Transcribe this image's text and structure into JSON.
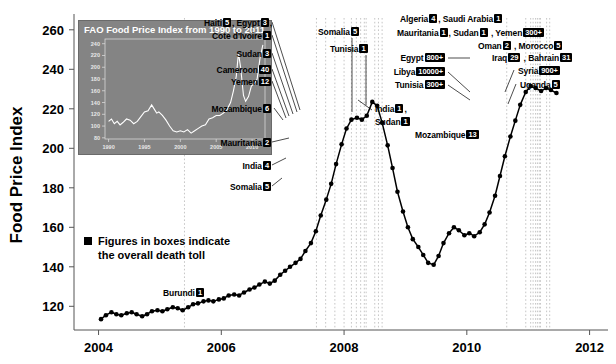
{
  "chart_data": {
    "type": "line",
    "title": "",
    "xlabel": "",
    "ylabel": "Food Price Index",
    "xlim": [
      2003.6,
      2012.3
    ],
    "ylim": [
      108,
      268
    ],
    "xticks": [
      "2004",
      "2006",
      "2008",
      "2010",
      "2012"
    ],
    "yticks": [
      "120",
      "140",
      "160",
      "180",
      "200",
      "220",
      "240",
      "260"
    ],
    "grid": false,
    "legend_note": "Figures in boxes indicate the overall death toll",
    "series": [
      {
        "name": "FAO Food Price Index",
        "x": [
          2004.04,
          2004.12,
          2004.21,
          2004.29,
          2004.37,
          2004.46,
          2004.54,
          2004.62,
          2004.71,
          2004.79,
          2004.87,
          2004.96,
          2005.04,
          2005.12,
          2005.21,
          2005.29,
          2005.37,
          2005.46,
          2005.54,
          2005.62,
          2005.71,
          2005.79,
          2005.87,
          2005.96,
          2006.04,
          2006.12,
          2006.21,
          2006.29,
          2006.37,
          2006.46,
          2006.54,
          2006.62,
          2006.71,
          2006.79,
          2006.87,
          2006.96,
          2007.04,
          2007.12,
          2007.21,
          2007.29,
          2007.37,
          2007.46,
          2007.54,
          2007.62,
          2007.71,
          2007.79,
          2007.87,
          2007.96,
          2008.04,
          2008.12,
          2008.21,
          2008.29,
          2008.37,
          2008.46,
          2008.54,
          2008.62,
          2008.71,
          2008.79,
          2008.87,
          2008.96,
          2009.04,
          2009.12,
          2009.21,
          2009.29,
          2009.37,
          2009.46,
          2009.54,
          2009.62,
          2009.71,
          2009.79,
          2009.87,
          2009.96,
          2010.04,
          2010.12,
          2010.21,
          2010.29,
          2010.37,
          2010.46,
          2010.54,
          2010.62,
          2010.71,
          2010.79,
          2010.87,
          2010.96,
          2011.04,
          2011.12,
          2011.21,
          2011.29,
          2011.37,
          2011.46
        ],
        "values": [
          113.5,
          115.5,
          117.0,
          116.0,
          115.5,
          116.5,
          117.0,
          116.0,
          115.0,
          116.0,
          117.5,
          118.0,
          117.5,
          118.5,
          119.5,
          119.0,
          118.0,
          119.5,
          121.0,
          121.5,
          122.5,
          123.0,
          122.5,
          123.5,
          124.0,
          125.5,
          126.0,
          125.5,
          127.0,
          128.5,
          129.5,
          131.0,
          132.5,
          131.5,
          133.0,
          136.0,
          138.0,
          140.0,
          142.0,
          144.0,
          148.0,
          152.0,
          158.0,
          166.0,
          174.0,
          182.0,
          192.0,
          202.0,
          210.0,
          214.5,
          215.5,
          214.5,
          216.5,
          223.5,
          221.5,
          213.0,
          201.5,
          190.0,
          178.0,
          168.0,
          160.0,
          154.0,
          150.0,
          146.0,
          142.0,
          141.0,
          145.5,
          152.0,
          157.0,
          160.0,
          158.5,
          156.0,
          157.0,
          155.5,
          157.5,
          161.5,
          167.5,
          176.0,
          186.0,
          196.0,
          206.0,
          214.0,
          222.0,
          228.5,
          231.5,
          230.5,
          229.0,
          230.5,
          229.5,
          228.0
        ]
      }
    ],
    "annotations": [
      {
        "id": "burundi",
        "text": "Burundi",
        "toll": "1",
        "x": 2005.4
      },
      {
        "id": "somalia-early",
        "text": "Somalia",
        "toll": "5",
        "x": 2007.55
      },
      {
        "id": "india-early",
        "text": "India",
        "toll": "4",
        "x": 2007.7
      },
      {
        "id": "mauritania",
        "text": "Mauritania",
        "toll": "2",
        "x": 2007.85
      },
      {
        "id": "mozambique-2008",
        "text": "Mozambique",
        "toll": "6",
        "x": 2008.0
      },
      {
        "id": "yemen",
        "text": "Yemen",
        "toll": "12",
        "x": 2008.12
      },
      {
        "id": "cameroon",
        "text": "Cameroon",
        "toll": "40",
        "x": 2008.2
      },
      {
        "id": "sudan-2008",
        "text": "Sudan",
        "toll": "3",
        "x": 2008.27
      },
      {
        "id": "cote-divoire",
        "text": "Cote d'Ivoire",
        "toll": "1",
        "x": 2008.33
      },
      {
        "id": "haiti-egypt",
        "text": "Haiti 5, Egypt 3",
        "toll": "",
        "x": 2008.36
      },
      {
        "id": "somalia-2008",
        "text": "Somalia",
        "toll": "5",
        "x": 2008.5
      },
      {
        "id": "tunisia-2008",
        "text": "Tunisia",
        "toll": "1",
        "x": 2008.56
      },
      {
        "id": "india-sudan",
        "text": "India 1, Sudan 1",
        "toll": "",
        "x": 2008.62
      },
      {
        "id": "mozambique-2010",
        "text": "Mozambique",
        "toll": "13",
        "x": 2010.65
      },
      {
        "id": "tunisia-2011",
        "text": "Tunisia",
        "toll": "300+",
        "x": 2010.96
      },
      {
        "id": "libya",
        "text": "Libya",
        "toll": "10000+",
        "x": 2011.04
      },
      {
        "id": "egypt-2011",
        "text": "Egypt",
        "toll": "800+",
        "x": 2011.08
      },
      {
        "id": "iraq-bahrain",
        "text": "Iraq 29, Bahrain 31",
        "toll": "",
        "x": 2011.12
      },
      {
        "id": "oman-morocco",
        "text": "Oman 2, Morocco 5",
        "toll": "",
        "x": 2011.15
      },
      {
        "id": "mauritania-sudan-yemen",
        "text": "Mauritania 1, Sudan 1, Yemen 300+",
        "toll": "",
        "x": 2011.18
      },
      {
        "id": "algeria-saudi",
        "text": "Algeria 4, Saudi Arabia 1",
        "toll": "",
        "x": 2011.2
      },
      {
        "id": "syria",
        "text": "Syria",
        "toll": "900+",
        "x": 2011.3
      },
      {
        "id": "uganda",
        "text": "Uganda",
        "toll": "5",
        "x": 2011.35
      }
    ]
  },
  "labels": {
    "annotation_boxes": {
      "haiti": "5",
      "egypt_2008": "3",
      "cote_divoire": "1",
      "sudan_2008": "3",
      "cameroon": "40",
      "yemen_2008": "12",
      "mozambique_2008": "6",
      "somalia_2008": "5",
      "tunisia_2008": "1",
      "india_2008": "1",
      "sudan_b_2008": "1",
      "mauritania_2007": "2",
      "india_2007": "4",
      "somalia_2007": "5",
      "burundi": "1",
      "mozambique_2010": "13",
      "tunisia_2011": "300+",
      "libya_2011": "10000+",
      "egypt_2011": "800+",
      "iraq": "29",
      "bahrain": "31",
      "oman": "2",
      "morocco": "5",
      "mauritania_2011": "1",
      "sudan_2011": "1",
      "yemen_2011": "300+",
      "algeria": "4",
      "saudi_arabia": "1",
      "syria": "900+",
      "uganda": "5"
    },
    "countries": {
      "haiti": "Haiti",
      "egypt": "Egypt",
      "cote_divoire": "Cote d'Ivoire",
      "sudan": "Sudan",
      "cameroon": "Cameroon",
      "yemen": "Yemen",
      "mozambique": "Mozambique",
      "somalia": "Somalia",
      "tunisia": "Tunisia",
      "india": "India",
      "mauritania": "Mauritania",
      "burundi": "Burundi",
      "libya": "Libya",
      "iraq": "Iraq",
      "bahrain": "Bahrain",
      "oman": "Oman",
      "morocco": "Morocco",
      "algeria": "Algeria",
      "saudi_arabia": "Saudi Arabia",
      "syria": "Syria",
      "uganda": "Uganda"
    },
    "legend_line1": "Figures in boxes indicate",
    "legend_line2": "the overall death toll"
  },
  "inset": {
    "title": "FAO Food Price Index from 1990 to 2011",
    "yticks": [
      "80",
      "100",
      "120",
      "140",
      "160",
      "180",
      "200",
      "220",
      "240"
    ],
    "xticks": [
      "1990",
      "1995",
      "2000",
      "2005",
      "2010"
    ],
    "background": "#848484",
    "line_color": "#ffffff",
    "chart_data": {
      "type": "line",
      "xlim": [
        1989.5,
        2011.8
      ],
      "ylim": [
        78,
        248
      ],
      "x": [
        1990,
        1990.4,
        1990.8,
        1991.2,
        1991.6,
        1992,
        1992.5,
        1993,
        1993.5,
        1994,
        1994.5,
        1995,
        1995.5,
        1996,
        1996.3,
        1996.7,
        1997,
        1997.5,
        1998,
        1998.5,
        1999,
        1999.5,
        2000,
        2000.5,
        2001,
        2001.5,
        2002,
        2002.5,
        2003,
        2003.5,
        2004,
        2004.5,
        2005,
        2005.5,
        2006,
        2006.5,
        2007,
        2007.4,
        2007.8,
        2008.1,
        2008.4,
        2008.8,
        2009.1,
        2009.5,
        2009.9,
        2010.3,
        2010.7,
        2011.1,
        2011.5
      ],
      "values": [
        108,
        112,
        104,
        108,
        102,
        106,
        112,
        110,
        104,
        108,
        116,
        124,
        126,
        136,
        130,
        122,
        124,
        118,
        110,
        100,
        92,
        90,
        92,
        90,
        94,
        88,
        92,
        96,
        100,
        102,
        112,
        114,
        118,
        118,
        122,
        128,
        140,
        160,
        185,
        224,
        200,
        152,
        142,
        150,
        168,
        172,
        180,
        215,
        238
      ]
    }
  }
}
